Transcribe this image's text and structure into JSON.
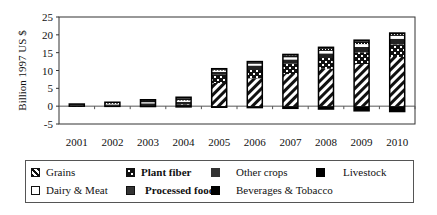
{
  "chart_data": {
    "type": "bar",
    "stacked": true,
    "title": "",
    "xlabel": "",
    "ylabel": "Billion 1997 US $",
    "ylim": [
      -5,
      25
    ],
    "yticks": [
      -5,
      0,
      5,
      10,
      15,
      20,
      25
    ],
    "grid": false,
    "legend_position": "bottom",
    "categories": [
      "2001",
      "2002",
      "2003",
      "2004",
      "2005",
      "2006",
      "2007",
      "2008",
      "2009",
      "2010"
    ],
    "series": [
      {
        "name": "Grains",
        "pattern": "diagonal-stripes",
        "values": [
          0,
          0,
          0,
          0,
          6.5,
          7.8,
          9.0,
          10.5,
          11.8,
          13.8
        ]
      },
      {
        "name": "Plant fiber",
        "pattern": "checker",
        "values": [
          0.1,
          0.2,
          0.3,
          0.5,
          2.3,
          2.6,
          2.9,
          3.0,
          3.3,
          3.5
        ]
      },
      {
        "name": "Other crops",
        "pattern": "solid-dark",
        "values": [
          0.2,
          0.3,
          0.5,
          0.7,
          0.8,
          1.0,
          1.2,
          1.3,
          1.5,
          1.6
        ]
      },
      {
        "name": "Livestock",
        "pattern": "solid-black",
        "values": [
          0,
          -0.05,
          -0.1,
          -0.2,
          -0.3,
          -0.4,
          -0.6,
          -0.8,
          -1.3,
          -1.5
        ]
      },
      {
        "name": "Dairy & Meat",
        "pattern": "white",
        "values": [
          0.1,
          0.2,
          0.3,
          0.4,
          0.4,
          0.5,
          0.6,
          0.7,
          0.8,
          0.8
        ]
      },
      {
        "name": "Processed food",
        "pattern": "dotted",
        "values": [
          0.1,
          0.2,
          0.4,
          0.6,
          0.3,
          0.4,
          0.5,
          0.6,
          0.7,
          0.5
        ]
      },
      {
        "name": "Beverages & Tobacco",
        "pattern": "solid-black",
        "values": [
          0.1,
          0.2,
          0.3,
          0.3,
          0.2,
          0.2,
          0.3,
          0.4,
          0.4,
          0.3
        ]
      }
    ],
    "totals_positive": [
      0.6,
      1.1,
      1.8,
      2.5,
      10.5,
      12.5,
      14.5,
      16.5,
      18.5,
      20.5
    ]
  },
  "legend": {
    "items": [
      {
        "label": "Grains"
      },
      {
        "label": "Plant fiber"
      },
      {
        "label": "Other crops"
      },
      {
        "label": "Livestock"
      },
      {
        "label": "Dairy & Meat"
      },
      {
        "label": "Processed food"
      },
      {
        "label": "Beverages & Tobacco"
      }
    ]
  }
}
